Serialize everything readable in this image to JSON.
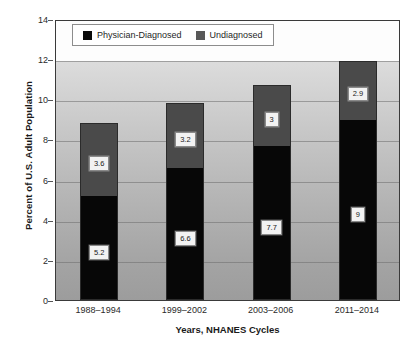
{
  "chart_data": {
    "type": "bar",
    "subtype": "stacked-bar",
    "title": "",
    "xlabel": "Years, NHANES Cycles",
    "ylabel": "Percent of U.S. Adult Population",
    "categories": [
      "1988–1994",
      "1999–2002",
      "2003–2006",
      "2011–2014"
    ],
    "series": [
      {
        "name": "Physician-Diagnosed",
        "color": "#070707",
        "values": [
          5.2,
          6.6,
          7.7,
          9
        ],
        "labels": [
          "5.2",
          "6.6",
          "7.7",
          "9"
        ]
      },
      {
        "name": "Undiagnosed",
        "color": "#4a4a4a",
        "values": [
          3.6,
          3.2,
          3,
          2.9
        ],
        "labels": [
          "3.6",
          "3.2",
          "3",
          "2.9"
        ]
      }
    ],
    "totals": [
      8.8,
      9.8,
      10.7,
      11.9
    ],
    "ylim": [
      0,
      14
    ],
    "yticks": [
      0,
      2,
      4,
      6,
      8,
      10,
      12,
      14
    ],
    "ytick_labels": [
      "0",
      "2",
      "4",
      "6",
      "8",
      "10",
      "12",
      "14"
    ],
    "grid": true,
    "grid_axis": "y",
    "legend_position": "top-left-inside"
  },
  "legend": {
    "items": [
      {
        "label": "Physician-Diagnosed",
        "swatch": "black-square-icon"
      },
      {
        "label": "Undiagnosed",
        "swatch": "gray-square-icon"
      }
    ]
  }
}
